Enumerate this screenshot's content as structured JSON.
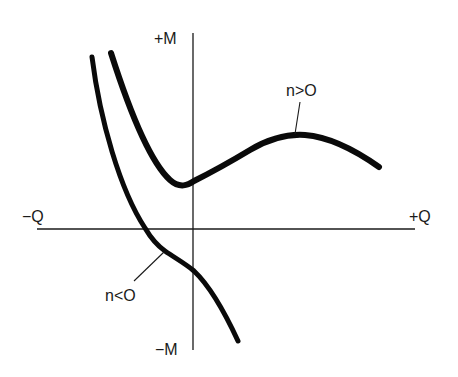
{
  "axes": {
    "y_positive_label": "+M",
    "y_negative_label": "−M",
    "x_negative_label": "−Q",
    "x_positive_label": "+Q"
  },
  "curves": [
    {
      "name": "n-positive",
      "label": "n>O"
    },
    {
      "name": "n-negative",
      "label": "n<O"
    }
  ],
  "colors": {
    "ink": "#0a0a0a",
    "background": "#ffffff"
  }
}
